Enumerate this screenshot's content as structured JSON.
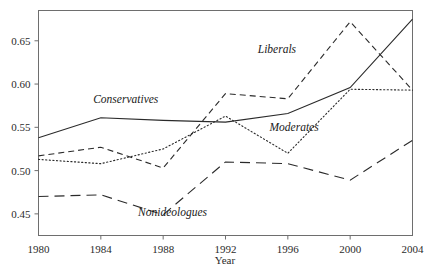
{
  "chart_data": {
    "type": "line",
    "title": "",
    "xlabel": "Year",
    "ylabel": "",
    "x": [
      1980,
      1984,
      1988,
      1992,
      1996,
      2000,
      2004
    ],
    "xlim": [
      1980,
      2004
    ],
    "ylim": [
      0.425,
      0.685
    ],
    "grid": false,
    "legend_position": "inline-annotations",
    "xtick_labels": [
      "1980",
      "1984",
      "1988",
      "1992",
      "1996",
      "2000",
      "2004"
    ],
    "ytick_values": [
      0.45,
      0.5,
      0.55,
      0.6,
      0.65
    ],
    "ytick_labels": [
      "0.45",
      "0.50",
      "0.55",
      "0.60",
      "0.65"
    ],
    "series": [
      {
        "name": "Conservatives",
        "style": "solid",
        "label_x": 1985.6,
        "label_y": 0.578,
        "values": [
          0.538,
          0.561,
          0.558,
          0.556,
          0.566,
          0.596,
          0.675
        ]
      },
      {
        "name": "Liberals",
        "style": "dashed",
        "label_x": 1995.3,
        "label_y": 0.636,
        "values": [
          0.517,
          0.527,
          0.503,
          0.589,
          0.583,
          0.672,
          0.593
        ]
      },
      {
        "name": "Moderates",
        "style": "dotted",
        "label_x": 1996.4,
        "label_y": 0.546,
        "values": [
          0.513,
          0.508,
          0.525,
          0.563,
          0.52,
          0.594,
          0.593
        ]
      },
      {
        "name": "Nonideologues",
        "style": "long-dashed",
        "label_x": 1988.6,
        "label_y": 0.447,
        "values": [
          0.47,
          0.472,
          0.449,
          0.51,
          0.508,
          0.489,
          0.535
        ]
      }
    ]
  },
  "axes": {
    "x_title": "Year"
  },
  "labels": {
    "conservatives": "Conservatives",
    "liberals": "Liberals",
    "moderates": "Moderates",
    "nonideologues": "Nonideologues"
  },
  "ticks": {
    "x": [
      "1980",
      "1984",
      "1988",
      "1992",
      "1996",
      "2000",
      "2004"
    ],
    "y": [
      "0.45",
      "0.50",
      "0.55",
      "0.60",
      "0.65"
    ]
  },
  "colors": {
    "line": "#2a2a2a",
    "frame": "#6e6e6e",
    "text": "#1a1a1a",
    "background": "#ffffff"
  }
}
